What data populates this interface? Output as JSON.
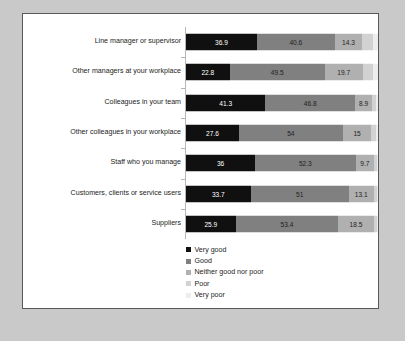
{
  "chart_data": {
    "type": "bar",
    "title": "",
    "subtitle": "",
    "xlabel": "",
    "ylabel": "",
    "orientation": "horizontal",
    "stacked": true,
    "stack_mode": "percent",
    "xlim": [
      0,
      100
    ],
    "grid": false,
    "legend_position": "bottom-left",
    "categories": [
      "Line manager or supervisor",
      "Other managers at your workplace",
      "Colleagues in your team",
      "Other colleagues in your workplace",
      "Staff who you manage",
      "Customers, clients or service users",
      "Suppliers"
    ],
    "series": [
      {
        "name": "Very good",
        "color": "#101010",
        "values": [
          36.9,
          22.8,
          41.3,
          27.6,
          36,
          33.7,
          25.9
        ],
        "labels": [
          "36.9",
          "22.8",
          "41.3",
          "27.6",
          "36",
          "33.7",
          "25.9"
        ],
        "labels_shown": true
      },
      {
        "name": "Good",
        "color": "#808080",
        "values": [
          40.6,
          49.5,
          46.8,
          54,
          52.3,
          51,
          53.4
        ],
        "labels": [
          "40.6",
          "49.5",
          "46.8",
          "54",
          "52.3",
          "51",
          "53.4"
        ],
        "labels_shown": true
      },
      {
        "name": "Neither good nor poor",
        "color": "#b0b0b0",
        "values": [
          14.3,
          19.7,
          8.9,
          15,
          9.7,
          13.1,
          18.5
        ],
        "labels": [
          "14.3",
          "19.7",
          "8.9",
          "15",
          "9.7",
          "13.1",
          "18.5"
        ],
        "labels_shown": true
      },
      {
        "name": "Poor",
        "color": "#d2d2d2",
        "values": [
          5.5,
          5.4,
          2.1,
          2.4,
          1.4,
          1.6,
          1.5
        ],
        "labels": [
          "",
          "",
          "",
          "",
          "",
          "",
          ""
        ],
        "labels_shown": false
      },
      {
        "name": "Very poor",
        "color": "#ededed",
        "values": [
          2.7,
          2.6,
          0.9,
          1.0,
          0.6,
          0.6,
          0.7
        ],
        "labels": [
          "",
          "",
          "",
          "",
          "",
          "",
          ""
        ],
        "labels_shown": false
      }
    ],
    "legend": [
      "Very good",
      "Good",
      "Neither good nor poor",
      "Poor",
      "Very poor"
    ]
  },
  "colors": {
    "background": "#c9c9c9",
    "panel": "#ffffff",
    "panel_border": "#58585a",
    "axis": "#b6b6b6",
    "text": "#232323"
  }
}
